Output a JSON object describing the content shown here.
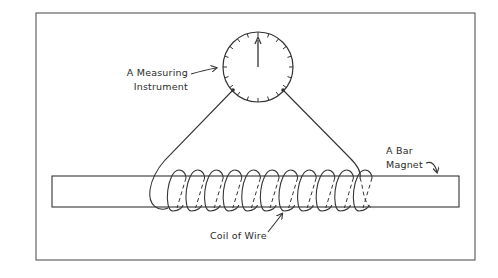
{
  "diagram": {
    "labels": {
      "instrument": [
        "A Measuring",
        "Instrument"
      ],
      "magnet": [
        "A Bar",
        "Magnet"
      ],
      "coil": "Coil of Wire"
    },
    "components": [
      {
        "id": "measuring-instrument",
        "type": "dial-meter",
        "ticks": 20,
        "needle": "pointing up"
      },
      {
        "id": "bar-magnet",
        "type": "rectangle"
      },
      {
        "id": "coil",
        "type": "wire-coil",
        "turns": 11
      },
      {
        "id": "wire-leads",
        "type": "wire",
        "count": 2
      }
    ],
    "colors": {
      "line": "#333333",
      "background": "#ffffff",
      "frame": "#555555"
    }
  }
}
